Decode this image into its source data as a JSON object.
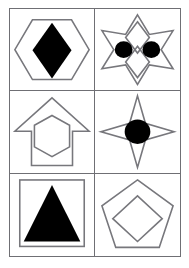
{
  "figure": {
    "background_color": "#ffffff",
    "border_color": "#6f6f74",
    "outline_color": "#77777c",
    "fill_color": "#000000",
    "columns": 2,
    "rows": 3
  },
  "cells": [
    {
      "id": "cell-1",
      "position": "row1-col1",
      "outer_shape": "hexagon",
      "outer_style": "outline",
      "inner_shape": "diamond",
      "inner_style": "filled-black",
      "label": "hexagon-with-filled-diamond"
    },
    {
      "id": "cell-2",
      "position": "row1-col2",
      "outer_shape": "six-pointed-star",
      "outer_style": "outline",
      "inner_shape": "two-diamonds-two-circles",
      "inner_style": "outline-and-filled-black",
      "label": "six-pointed-star-with-diamonds-and-circles"
    },
    {
      "id": "cell-3",
      "position": "row2-col1",
      "outer_shape": "up-arrow",
      "outer_style": "outline",
      "inner_shape": "hexagon",
      "inner_style": "outline",
      "label": "up-arrow-with-hexagon"
    },
    {
      "id": "cell-4",
      "position": "row2-col2",
      "outer_shape": "four-pointed-star",
      "outer_style": "outline",
      "inner_shape": "circle",
      "inner_style": "filled-black",
      "label": "four-pointed-star-with-filled-circle"
    },
    {
      "id": "cell-5",
      "position": "row3-col1",
      "outer_shape": "square",
      "outer_style": "outline",
      "inner_shape": "triangle",
      "inner_style": "filled-black",
      "label": "square-with-filled-triangle"
    },
    {
      "id": "cell-6",
      "position": "row3-col2",
      "outer_shape": "pentagon",
      "outer_style": "outline",
      "inner_shape": "diamond",
      "inner_style": "outline",
      "label": "pentagon-with-diamond"
    }
  ]
}
